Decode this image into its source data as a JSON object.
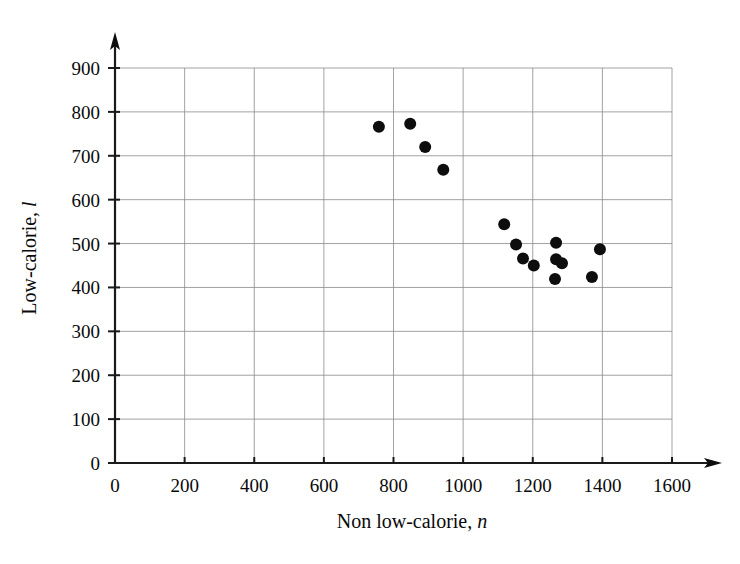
{
  "chart_data": {
    "type": "scatter",
    "title": "",
    "xlabel": "Non low-calorie, n",
    "xlabel_main": "Non low-calorie,",
    "xlabel_symbol": "n",
    "ylabel": "Low-calorie, l",
    "ylabel_main": "Low-calorie,",
    "ylabel_symbol": "l",
    "xlim": [
      0,
      1600
    ],
    "ylim": [
      0,
      900
    ],
    "xticks": [
      0,
      200,
      400,
      600,
      800,
      1000,
      1200,
      1400,
      1600
    ],
    "yticks": [
      0,
      100,
      200,
      300,
      400,
      500,
      600,
      700,
      800,
      900
    ],
    "xtick_labels": [
      "0",
      "200",
      "400",
      "600",
      "800",
      "1000",
      "1200",
      "1400",
      "1600"
    ],
    "ytick_labels": [
      "0",
      "100",
      "200",
      "300",
      "400",
      "500",
      "600",
      "700",
      "800",
      "900"
    ],
    "grid": true,
    "grid_x_values": [
      200,
      400,
      600,
      800,
      1000,
      1200,
      1400,
      1600
    ],
    "grid_y_values": [
      100,
      200,
      300,
      400,
      500,
      600,
      700,
      800,
      900
    ],
    "legend": "none",
    "marker": "filled-circle",
    "marker_color": "#0d0d0d",
    "marker_size": 6,
    "points": [
      {
        "n": 758,
        "l": 766
      },
      {
        "n": 848,
        "l": 773
      },
      {
        "n": 891,
        "l": 720
      },
      {
        "n": 943,
        "l": 668
      },
      {
        "n": 1118,
        "l": 544
      },
      {
        "n": 1152,
        "l": 498
      },
      {
        "n": 1172,
        "l": 466
      },
      {
        "n": 1203,
        "l": 450
      },
      {
        "n": 1267,
        "l": 502
      },
      {
        "n": 1267,
        "l": 464
      },
      {
        "n": 1284,
        "l": 455
      },
      {
        "n": 1264,
        "l": 419
      },
      {
        "n": 1370,
        "l": 424
      },
      {
        "n": 1393,
        "l": 487
      }
    ],
    "point_count": 14
  }
}
